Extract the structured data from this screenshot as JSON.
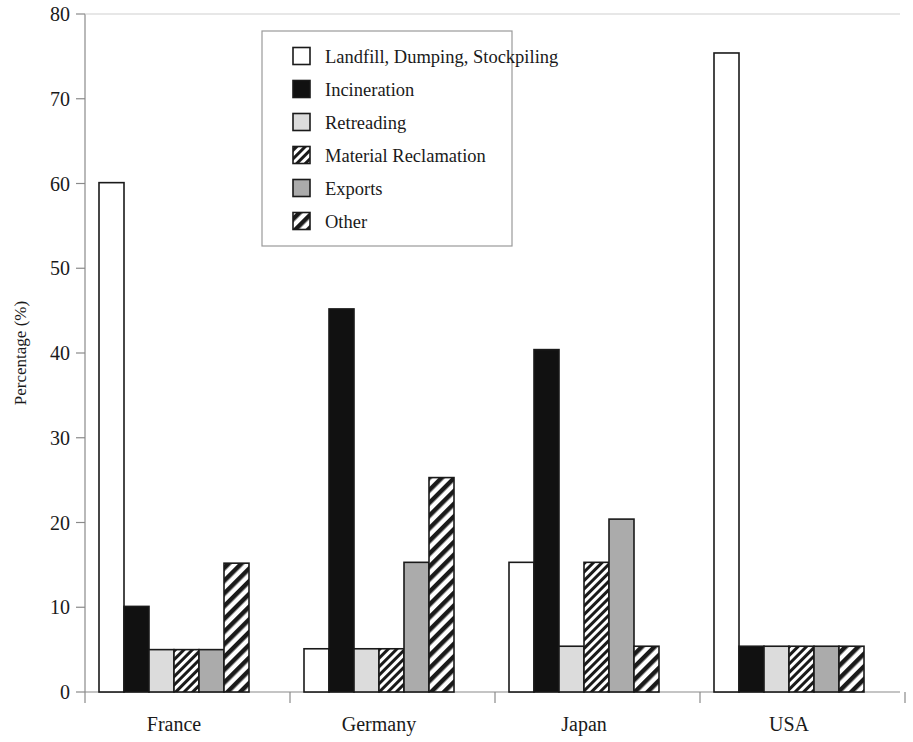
{
  "chart_data": {
    "type": "bar",
    "title": "",
    "subtitle": "",
    "xlabel": "",
    "ylabel": "Percentage (%)",
    "ylim": [
      0,
      80
    ],
    "ytick_step": 10,
    "yticks": [
      "0",
      "10",
      "20",
      "30",
      "40",
      "50",
      "60",
      "70",
      "80"
    ],
    "grid": false,
    "legend_position": "top-center-inside",
    "categories": [
      "France",
      "Germany",
      "Japan",
      "USA"
    ],
    "series": [
      {
        "name": "Landfill, Dumping, Stockpiling",
        "pattern": "open-white",
        "values": [
          60.1,
          5.1,
          15.3,
          75.4
        ]
      },
      {
        "name": "Incineration",
        "pattern": "solid-black",
        "values": [
          10.1,
          45.2,
          40.4,
          5.4
        ]
      },
      {
        "name": "Retreading",
        "pattern": "solid-light-gray",
        "values": [
          5.0,
          5.1,
          5.4,
          5.4
        ]
      },
      {
        "name": "Material Reclamation",
        "pattern": "dense-diagonal-hatch",
        "values": [
          5.0,
          5.1,
          15.3,
          5.4
        ]
      },
      {
        "name": "Exports",
        "pattern": "solid-medium-gray",
        "values": [
          5.0,
          15.3,
          20.4,
          5.4
        ]
      },
      {
        "name": "Other",
        "pattern": "wide-diagonal-hatch",
        "values": [
          15.2,
          25.3,
          5.4,
          5.4
        ]
      }
    ]
  },
  "legend": {
    "items": [
      {
        "label": "Landfill, Dumping, Stockpiling",
        "swatch": "open-white"
      },
      {
        "label": "Incineration",
        "swatch": "solid-black"
      },
      {
        "label": "Retreading",
        "swatch": "solid-light-gray"
      },
      {
        "label": "Material Reclamation",
        "swatch": "dense-diagonal-hatch"
      },
      {
        "label": "Exports",
        "swatch": "solid-medium-gray"
      },
      {
        "label": "Other",
        "swatch": "wide-diagonal-hatch"
      }
    ]
  },
  "colors": {
    "axis": "#8a8a8a",
    "bar_outline": "#1a1a1a",
    "black_fill": "#111111",
    "light_gray_fill": "#dcdcdc",
    "medium_gray_fill": "#ababab",
    "white_fill": "#ffffff",
    "hatch_line": "#1a1a1a",
    "legend_border": "#9a9a9a",
    "text": "#1a1a1a",
    "background": "#ffffff"
  },
  "geometry": {
    "plot_left": 85,
    "plot_right": 900,
    "baseline_y": 692,
    "top_y": 14,
    "bar_width": 25,
    "group_starts": [
      99,
      304,
      509,
      714
    ]
  }
}
